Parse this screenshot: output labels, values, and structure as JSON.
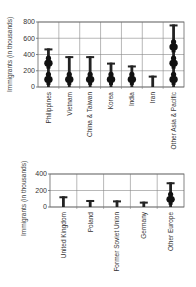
{
  "chart_data": [
    {
      "type": "bar",
      "style": "pictograph",
      "title": "",
      "xlabel": "",
      "ylabel": "Immigrants (in thousands)",
      "ylim": [
        0,
        800
      ],
      "yticks": [
        0,
        200,
        400,
        600,
        800
      ],
      "grid": true,
      "icon_unit": 200,
      "categories": [
        "Philippines",
        "Vietnam",
        "China & Taiwan",
        "Korea",
        "India",
        "Iran",
        "Other Asia & Pacific"
      ],
      "values": [
        475,
        380,
        380,
        300,
        265,
        140,
        770
      ]
    },
    {
      "type": "bar",
      "style": "pictograph",
      "title": "",
      "xlabel": "",
      "ylabel": "Immigrants (in thousands)",
      "ylim": [
        0,
        400
      ],
      "yticks": [
        0,
        200,
        400
      ],
      "grid": true,
      "icon_unit": 200,
      "categories": [
        "United Kingdom",
        "Poland",
        "Former Soviet Union",
        "Germany",
        "Other Europe"
      ],
      "values": [
        130,
        85,
        80,
        65,
        300
      ]
    }
  ]
}
